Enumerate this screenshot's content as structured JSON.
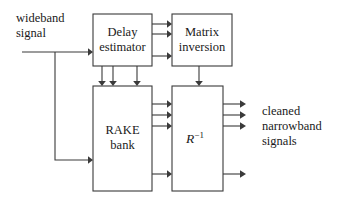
{
  "diagram": {
    "type": "block-diagram",
    "colors": {
      "background": "#ffffff",
      "stroke": "#3a3a3a",
      "text": "#1a1a1a"
    },
    "blocks": [
      {
        "id": "delay-estimator",
        "label_line1": "Delay",
        "label_line2": "estimator",
        "x": 93,
        "y": 14,
        "w": 59,
        "h": 52
      },
      {
        "id": "matrix-inversion",
        "label_line1": "Matrix",
        "label_line2": "inversion",
        "x": 172,
        "y": 14,
        "w": 60,
        "h": 52
      },
      {
        "id": "rake-bank",
        "label_line1": "RAKE",
        "label_line2": "bank",
        "x": 93,
        "y": 86,
        "w": 59,
        "h": 105
      },
      {
        "id": "r-inverse",
        "label_base": "R",
        "label_exponent": "−1",
        "x": 172,
        "y": 86,
        "w": 51,
        "h": 105
      }
    ],
    "labels": [
      {
        "id": "input-label",
        "line1": "wideband",
        "line2": "signal",
        "x": 16,
        "y": 22
      },
      {
        "id": "output-label",
        "line1": "cleaned",
        "line2": "narrowband",
        "x": 262,
        "y": 115
      }
    ],
    "output_label_line3": "signals",
    "connections": [
      {
        "id": "input-to-delay-estimator",
        "count": 1
      },
      {
        "id": "input-to-rake-bank",
        "count": 1
      },
      {
        "id": "delay-estimator-to-matrix-inversion",
        "count": 3
      },
      {
        "id": "delay-estimator-to-rake-bank",
        "count": 3
      },
      {
        "id": "matrix-inversion-to-r-inverse",
        "count": 1
      },
      {
        "id": "rake-bank-to-r-inverse",
        "count": 4
      },
      {
        "id": "r-inverse-outputs",
        "count": 4
      }
    ]
  }
}
